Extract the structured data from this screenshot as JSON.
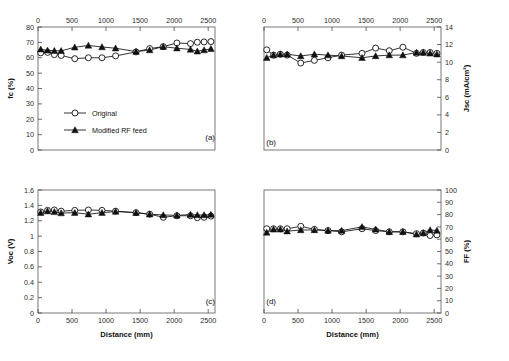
{
  "figure": {
    "title": "",
    "xlabel": "Distance (mm)",
    "panel_labels": [
      "(a)",
      "(b)",
      "(c)",
      "(d)"
    ],
    "legend": {
      "original": "Original",
      "modified": "Modified RF feed"
    }
  },
  "chart_data": [
    {
      "type": "line",
      "panel": "(a)",
      "title": "",
      "xlabel": "Distance (mm)",
      "ylabel": "fc (%)",
      "xlim": [
        0,
        2600
      ],
      "ylim": [
        0,
        80
      ],
      "xticks": [
        0,
        500,
        1000,
        1500,
        2000,
        2500
      ],
      "yticks": [
        0,
        10,
        20,
        30,
        40,
        50,
        60,
        70,
        80
      ],
      "xtick_position": "top",
      "ytick_position": "left",
      "grid": false,
      "legend_position": "center-left",
      "x": [
        40,
        140,
        240,
        340,
        540,
        740,
        940,
        1140,
        1440,
        1640,
        1840,
        2040,
        2240,
        2340,
        2440,
        2540
      ],
      "series": [
        {
          "name": "Original",
          "marker": "open-circle",
          "values": [
            63.2,
            63.5,
            62.0,
            61.5,
            59.4,
            60.0,
            60.0,
            61.2,
            63.8,
            66.0,
            67.2,
            69.6,
            69.2,
            70.1,
            70.3,
            70.5
          ]
        },
        {
          "name": "Modified RF feed",
          "marker": "filled-triangle",
          "values": [
            65.5,
            64.8,
            64.6,
            64.5,
            66.8,
            68.0,
            67.0,
            66.2,
            64.0,
            65.0,
            67.2,
            66.2,
            65.4,
            64.2,
            65.0,
            65.8
          ]
        }
      ]
    },
    {
      "type": "line",
      "panel": "(b)",
      "title": "",
      "xlabel": "Distance (mm)",
      "ylabel": "Jsc (mA/cm²)",
      "xlim": [
        0,
        2600
      ],
      "ylim": [
        0,
        14
      ],
      "xticks": [
        0,
        500,
        1000,
        1500,
        2000,
        2500
      ],
      "yticks": [
        0,
        2,
        4,
        6,
        8,
        10,
        12,
        14
      ],
      "xtick_position": "top",
      "ytick_position": "right",
      "grid": false,
      "legend_position": "none",
      "x": [
        40,
        140,
        240,
        340,
        540,
        740,
        940,
        1140,
        1440,
        1640,
        1840,
        2040,
        2240,
        2340,
        2440,
        2540
      ],
      "series": [
        {
          "name": "Original",
          "marker": "open-circle",
          "values": [
            11.4,
            10.8,
            10.9,
            10.8,
            9.9,
            10.2,
            10.5,
            10.8,
            11.0,
            11.6,
            11.3,
            11.7,
            11.0,
            11.1,
            11.1,
            11.0
          ]
        },
        {
          "name": "Modified RF feed",
          "marker": "filled-triangle",
          "values": [
            10.5,
            10.8,
            10.9,
            10.9,
            10.7,
            10.9,
            10.8,
            10.7,
            10.5,
            10.7,
            10.8,
            10.8,
            11.1,
            11.1,
            11.0,
            10.9
          ]
        }
      ]
    },
    {
      "type": "line",
      "panel": "(c)",
      "title": "",
      "xlabel": "Distance (mm)",
      "ylabel": "Voc (V)",
      "xlim": [
        0,
        2600
      ],
      "ylim": [
        0,
        1.6
      ],
      "xticks": [
        0,
        500,
        1000,
        1500,
        2000,
        2500
      ],
      "yticks": [
        0,
        0.2,
        0.4,
        0.6,
        0.8,
        1,
        1.2,
        1.4,
        1.6
      ],
      "xtick_position": "bottom",
      "ytick_position": "left",
      "grid": false,
      "legend_position": "none",
      "x": [
        40,
        140,
        240,
        340,
        540,
        740,
        940,
        1140,
        1440,
        1640,
        1840,
        2040,
        2240,
        2340,
        2440,
        2540
      ],
      "series": [
        {
          "name": "Original",
          "marker": "open-circle",
          "values": [
            1.315,
            1.335,
            1.34,
            1.325,
            1.335,
            1.34,
            1.335,
            1.325,
            1.305,
            1.285,
            1.245,
            1.265,
            1.265,
            1.24,
            1.245,
            1.26
          ]
        },
        {
          "name": "Modified RF feed",
          "marker": "filled-triangle",
          "values": [
            1.305,
            1.325,
            1.315,
            1.3,
            1.305,
            1.285,
            1.305,
            1.32,
            1.305,
            1.285,
            1.275,
            1.27,
            1.28,
            1.275,
            1.275,
            1.28
          ]
        }
      ]
    },
    {
      "type": "line",
      "panel": "(d)",
      "title": "",
      "xlabel": "Distance (mm)",
      "ylabel": "FF (%)",
      "xlim": [
        0,
        2600
      ],
      "ylim": [
        0,
        100
      ],
      "xticks": [
        0,
        500,
        1000,
        1500,
        2000,
        2500
      ],
      "yticks": [
        0,
        10,
        20,
        30,
        40,
        50,
        60,
        70,
        80,
        90,
        100
      ],
      "xtick_position": "bottom",
      "ytick_position": "right",
      "grid": false,
      "legend_position": "none",
      "x": [
        40,
        140,
        240,
        340,
        540,
        740,
        940,
        1140,
        1440,
        1640,
        1840,
        2040,
        2240,
        2340,
        2440,
        2540
      ],
      "series": [
        {
          "name": "Original",
          "marker": "open-circle",
          "values": [
            68.5,
            68.5,
            68.5,
            68.5,
            70.5,
            68.0,
            67.0,
            66.0,
            68.5,
            67.0,
            66.0,
            66.0,
            64.5,
            65.0,
            63.0,
            63.5
          ]
        },
        {
          "name": "Modified RF feed",
          "marker": "filled-triangle",
          "values": [
            65.5,
            68.0,
            68.0,
            66.5,
            67.5,
            67.5,
            67.0,
            67.0,
            70.0,
            68.0,
            66.0,
            66.0,
            64.0,
            65.0,
            67.5,
            67.0
          ]
        }
      ]
    }
  ]
}
